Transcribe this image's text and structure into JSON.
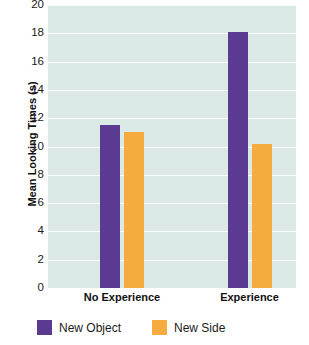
{
  "chart_data": {
    "type": "bar",
    "title": "",
    "subtitle": "",
    "xlabel": "",
    "ylabel": "Mean Looking Times (s)",
    "categories": [
      "No Experience",
      "Experience"
    ],
    "series": [
      {
        "name": "New Object",
        "color": "#5b3a92",
        "values": [
          11.5,
          18.1
        ]
      },
      {
        "name": "New Side",
        "color": "#f6ab3e",
        "values": [
          11.0,
          10.2
        ]
      }
    ],
    "ylim": [
      0,
      20
    ],
    "ytick_step": 2,
    "ytick_labels": [
      "20",
      "18",
      "16",
      "14",
      "12",
      "10",
      "8",
      "6",
      "4",
      "2",
      "0"
    ],
    "ytick_values": [
      20,
      18,
      16,
      14,
      12,
      10,
      8,
      6,
      4,
      2,
      0
    ],
    "grid": true,
    "grid_orientation": "horizontal",
    "grid_color": "#fbfdfc",
    "plot_background": "#dbeae6",
    "page_background": "#ffffff",
    "legend_position": "bottom",
    "legend": [
      {
        "label": "New Object",
        "color": "#5b3a92"
      },
      {
        "label": "New Side",
        "color": "#f6ab3e"
      }
    ]
  }
}
